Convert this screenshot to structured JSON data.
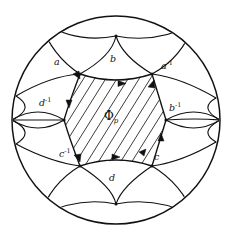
{
  "figure": {
    "ink_color": "#111111",
    "background_color": "#ffffff",
    "width": 232,
    "height": 238
  },
  "disk": {
    "name": "unit-disk-boundary",
    "center_x": 116,
    "center_y": 120,
    "radius": 104
  },
  "center_region": {
    "name": "fundamental-domain",
    "symbol": "Φ",
    "subscript": "p",
    "hatched": true
  },
  "edge_labels": [
    {
      "id": "a",
      "text": "a",
      "sup": "",
      "x": 56,
      "y": 62,
      "side": "top-left"
    },
    {
      "id": "b",
      "text": "b",
      "sup": "",
      "x": 111,
      "y": 58,
      "side": "top-center"
    },
    {
      "id": "a-inv",
      "text": "a",
      "sup": "-1",
      "x": 163,
      "y": 65,
      "side": "top-right"
    },
    {
      "id": "d-inv",
      "text": "d",
      "sup": "-1",
      "x": 41,
      "y": 102,
      "side": "left"
    },
    {
      "id": "b-inv",
      "text": "b",
      "sup": "-1",
      "x": 170,
      "y": 107,
      "side": "right"
    },
    {
      "id": "c-inv",
      "text": "c",
      "sup": "-1",
      "x": 61,
      "y": 152,
      "side": "bottom-left"
    },
    {
      "id": "c",
      "text": "c",
      "sup": "",
      "x": 155,
      "y": 155,
      "side": "bottom-right"
    },
    {
      "id": "d",
      "text": "d",
      "sup": "",
      "x": 110,
      "y": 176,
      "side": "bottom-center"
    }
  ],
  "center_label": {
    "name": "phi-p-label",
    "symbol": "Φ",
    "subscript": "p",
    "x": 104,
    "y": 110
  }
}
